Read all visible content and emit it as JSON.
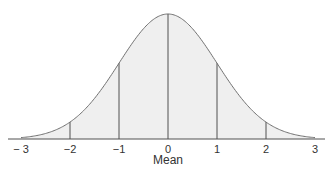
{
  "chart_data": {
    "type": "area",
    "title": "",
    "xlabel": "Mean",
    "ylabel": "",
    "distribution": "standard normal",
    "xlim": [
      -3,
      3
    ],
    "x_ticks": [
      -3,
      -2,
      -1,
      0,
      1,
      2,
      3
    ],
    "x_tick_labels": [
      "− 3",
      "−2",
      "−1",
      "0",
      "1",
      "2",
      "3"
    ],
    "vertical_lines_at": [
      -2,
      -1,
      0,
      1,
      2
    ],
    "grid": false,
    "legend": null
  },
  "colors": {
    "fill": "#efefef",
    "curve": "#707070",
    "lines": "#505050",
    "text": "#333333"
  }
}
